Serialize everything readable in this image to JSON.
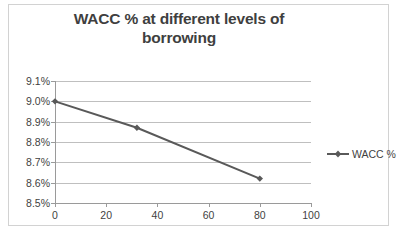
{
  "chart_data": {
    "type": "line",
    "title": "WACC % at different levels of borrowing",
    "title_line1": "WACC % at different levels of",
    "title_line2": "borrowing",
    "xlabel": "",
    "ylabel": "",
    "x": [
      0,
      32,
      80
    ],
    "series": [
      {
        "name": "WACC %",
        "values": [
          9.0,
          8.87,
          8.62
        ],
        "color": "#595959",
        "marker": "diamond"
      }
    ],
    "xlim": [
      0,
      100
    ],
    "ylim": [
      8.5,
      9.1
    ],
    "xticks": [
      0,
      20,
      40,
      60,
      80,
      100
    ],
    "xtick_labels": [
      "0",
      "20",
      "40",
      "60",
      "80",
      "100"
    ],
    "yticks": [
      8.5,
      8.6,
      8.7,
      8.8,
      8.9,
      9.0,
      9.1
    ],
    "ytick_labels": [
      "8.5%",
      "8.6%",
      "8.7%",
      "8.8%",
      "8.9%",
      "9.0%",
      "9.1%"
    ],
    "grid": true,
    "grid_axis": "y",
    "legend": [
      "WACC %"
    ],
    "legend_position": "right",
    "colors": {
      "series": "#595959",
      "gridline": "#bfbfbf",
      "axis": "#9a9a9a",
      "text": "#3f3f3f",
      "border": "#d2d2d2",
      "background": "#ffffff"
    }
  }
}
